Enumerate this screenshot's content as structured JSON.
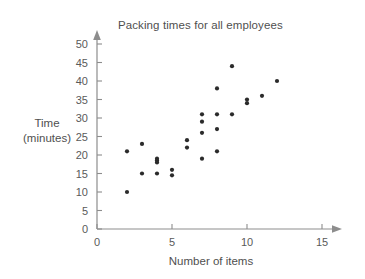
{
  "chart_data": {
    "type": "scatter",
    "title": "Packing times for all employees",
    "xlabel": "Number of items",
    "ylabel": "Time (minutes)",
    "ylabel_line1": "Time",
    "ylabel_line2": "(minutes)",
    "xlim": [
      0,
      15
    ],
    "ylim": [
      0,
      50
    ],
    "xticks": [
      0,
      5,
      10,
      15
    ],
    "yticks": [
      0,
      5,
      10,
      15,
      20,
      25,
      30,
      35,
      40,
      45,
      50
    ],
    "xtick_labels": [
      "0",
      "5",
      "10",
      "15"
    ],
    "ytick_labels": [
      "0",
      "5",
      "10",
      "15",
      "20",
      "25",
      "30",
      "35",
      "40",
      "45",
      "50"
    ],
    "grid": false,
    "legend": false,
    "point_color": "#2b2b2b",
    "axis_color": "#8d8d8d",
    "x": [
      2,
      2,
      3,
      3,
      4,
      4,
      4,
      4,
      5,
      5,
      6,
      6,
      7,
      7,
      7,
      7,
      8,
      8,
      8,
      8,
      9,
      9,
      10,
      10,
      11,
      12
    ],
    "y": [
      21,
      10,
      23,
      15,
      19,
      18.5,
      18,
      15,
      16,
      14.5,
      24,
      22,
      31,
      29,
      26,
      19,
      38,
      31,
      27,
      21,
      44,
      31,
      35,
      34,
      36,
      40
    ],
    "points": [
      {
        "x": 2,
        "y": 21
      },
      {
        "x": 2,
        "y": 10
      },
      {
        "x": 3,
        "y": 23
      },
      {
        "x": 3,
        "y": 15
      },
      {
        "x": 4,
        "y": 19
      },
      {
        "x": 4,
        "y": 18.5
      },
      {
        "x": 4,
        "y": 18
      },
      {
        "x": 4,
        "y": 15
      },
      {
        "x": 5,
        "y": 16
      },
      {
        "x": 5,
        "y": 14.5
      },
      {
        "x": 6,
        "y": 24
      },
      {
        "x": 6,
        "y": 22
      },
      {
        "x": 7,
        "y": 31
      },
      {
        "x": 7,
        "y": 29
      },
      {
        "x": 7,
        "y": 26
      },
      {
        "x": 7,
        "y": 19
      },
      {
        "x": 8,
        "y": 38
      },
      {
        "x": 8,
        "y": 31
      },
      {
        "x": 8,
        "y": 27
      },
      {
        "x": 8,
        "y": 21
      },
      {
        "x": 9,
        "y": 44
      },
      {
        "x": 9,
        "y": 31
      },
      {
        "x": 10,
        "y": 35
      },
      {
        "x": 10,
        "y": 34
      },
      {
        "x": 11,
        "y": 36
      },
      {
        "x": 12,
        "y": 40
      }
    ],
    "point_count": 26
  }
}
